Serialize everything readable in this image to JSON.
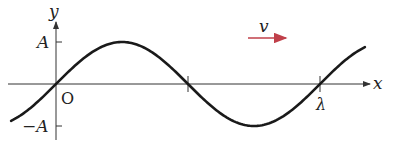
{
  "diagram": {
    "labels": {
      "y_axis": "y",
      "x_axis": "x",
      "origin": "O",
      "amplitude_pos": "A",
      "amplitude_neg": "−A",
      "wavelength": "λ",
      "velocity": "v"
    },
    "colors": {
      "curve": "#1a1a1a",
      "axes": "#333333",
      "velocity_arrow": "#c0404a"
    },
    "wave": {
      "function": "y = A sin(2πx/λ)",
      "x_range_wavelengths": [
        -0.17,
        1.17
      ],
      "ticks_wavelengths": [
        0.5,
        1.0
      ],
      "direction": "+x"
    }
  }
}
